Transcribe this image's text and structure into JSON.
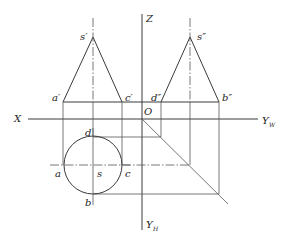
{
  "diagram": {
    "axes": {
      "x_label": "X",
      "z_label": "Z",
      "origin_label": "O",
      "yw_label": "Y",
      "yw_sub": "W",
      "yh_label": "Y",
      "yh_sub": "H"
    },
    "front_view": {
      "apex": "s′",
      "left_base": "a′",
      "right_base": "c′"
    },
    "side_view": {
      "apex": "s″",
      "left_base": "d″",
      "right_base": "b″"
    },
    "top_view": {
      "center": "s",
      "left": "a",
      "right": "c",
      "top": "d",
      "bottom": "b"
    },
    "colors": {
      "line": "#3a3a3a",
      "background": "#ffffff"
    }
  }
}
